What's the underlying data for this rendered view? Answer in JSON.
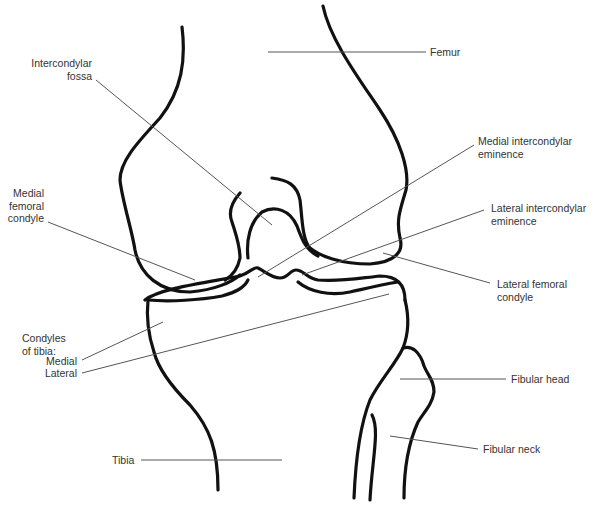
{
  "diagram": {
    "labels": {
      "femur": "Femur",
      "intercondylar_fossa": "Intercondylar\nfossa",
      "medial_femoral_condyle": "Medial\nfemoral\ncondyle",
      "medial_intercondylar_eminence": "Medial intercondylar\neminence",
      "lateral_intercondylar_eminence": "Lateral intercondylar\neminence",
      "lateral_femoral_condyle": "Lateral femoral\ncondyle",
      "condyles_of_tibia": "Condyles\nof tibia:",
      "condyles_medial": "Medial",
      "condyles_lateral": "Lateral",
      "fibular_head": "Fibular head",
      "fibular_neck": "Fibular neck",
      "tibia": "Tibia"
    },
    "colors": {
      "outline": "#111111",
      "leader": "#555555",
      "text": "#333333",
      "background": "#ffffff"
    }
  }
}
